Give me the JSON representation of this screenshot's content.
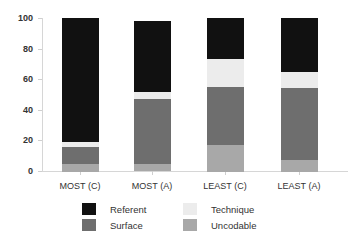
{
  "chart_data": {
    "type": "bar",
    "stacked": true,
    "title": "",
    "xlabel": "",
    "ylabel": "",
    "ylim": [
      0,
      100
    ],
    "yticks": [
      0,
      20,
      40,
      60,
      80,
      100
    ],
    "grid": false,
    "legend_position": "bottom",
    "categories": [
      "MOST (C)",
      "MOST (A)",
      "LEAST (C)",
      "LEAST (A)"
    ],
    "series": [
      {
        "name": "Uncodable",
        "color": "#a8a8a8",
        "values": [
          5,
          5,
          17,
          7.5
        ]
      },
      {
        "name": "Surface",
        "color": "#6e6e6e",
        "values": [
          11,
          42,
          38,
          47
        ]
      },
      {
        "name": "Technique",
        "color": "#ececec",
        "values": [
          3.5,
          5,
          18,
          10.5
        ]
      },
      {
        "name": "Referent",
        "color": "#111111",
        "values": [
          80.5,
          46,
          27,
          35
        ]
      }
    ]
  },
  "axis": {
    "y_tick_labels": [
      "0",
      "20",
      "40",
      "60",
      "80",
      "100"
    ]
  },
  "legend": {
    "items": [
      {
        "label": "Referent",
        "color": "#111111"
      },
      {
        "label": "Technique",
        "color": "#ececec"
      },
      {
        "label": "Surface",
        "color": "#6e6e6e"
      },
      {
        "label": "Uncodable",
        "color": "#a8a8a8"
      }
    ]
  }
}
